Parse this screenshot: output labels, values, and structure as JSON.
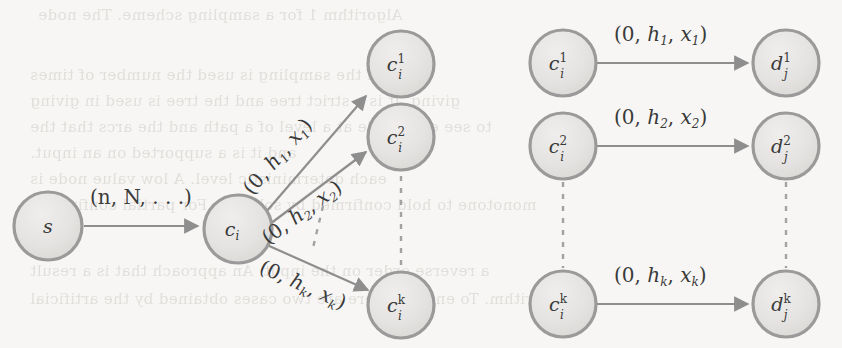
{
  "figure": {
    "name": "expansion-gadget-graph",
    "background_color": "#f7f6f4",
    "node_fill": "#e4e3e1",
    "node_stroke": "#9a9a9a",
    "edge_color": "#8e8e8e",
    "text_color": "#3a3a3a"
  },
  "left_group": {
    "source_node": {
      "label_base": "s",
      "label_sup": "",
      "label_sub": ""
    },
    "hub_node": {
      "label_base": "c",
      "label_sup": "",
      "label_sub": "i"
    },
    "targets": [
      {
        "label_base": "c",
        "label_sup": "1",
        "label_sub": "i"
      },
      {
        "label_base": "c",
        "label_sup": "2",
        "label_sub": "i"
      },
      {
        "label_base": "c",
        "label_sup": "k",
        "label_sub": "i"
      }
    ],
    "edges": [
      {
        "from": "s",
        "to": "c_i",
        "label": "(n, N, . . .)"
      },
      {
        "from": "c_i",
        "to": "c_i^1",
        "label_parts": [
          "(0, ",
          "h",
          "1",
          ", ",
          "x",
          "1",
          ")"
        ]
      },
      {
        "from": "c_i",
        "to": "c_i^2",
        "label_parts": [
          "(0, ",
          "h",
          "2",
          ", ",
          "x",
          "2",
          ")"
        ]
      },
      {
        "from": "c_i",
        "to": "c_i^k",
        "label_parts": [
          "(0, ",
          "h",
          "k",
          ", ",
          "x",
          "k",
          ")"
        ]
      }
    ]
  },
  "right_group": {
    "sources": [
      {
        "label_base": "c",
        "label_sup": "1",
        "label_sub": "i"
      },
      {
        "label_base": "c",
        "label_sup": "2",
        "label_sub": "i"
      },
      {
        "label_base": "c",
        "label_sup": "k",
        "label_sub": "i"
      }
    ],
    "targets": [
      {
        "label_base": "d",
        "label_sup": "1",
        "label_sub": "j"
      },
      {
        "label_base": "d",
        "label_sup": "2",
        "label_sub": "j"
      },
      {
        "label_base": "d",
        "label_sup": "k",
        "label_sub": "j"
      }
    ],
    "edges": [
      {
        "from": "c_i^1",
        "to": "d_j^1",
        "label_parts": [
          "(0, ",
          "h",
          "1",
          ", ",
          "x",
          "1",
          ")"
        ]
      },
      {
        "from": "c_i^2",
        "to": "d_j^2",
        "label_parts": [
          "(0, ",
          "h",
          "2",
          ", ",
          "x",
          "2",
          ")"
        ]
      },
      {
        "from": "c_i^k",
        "to": "d_j^k",
        "label_parts": [
          "(0, ",
          "h",
          "k",
          ", ",
          "x",
          "k",
          ")"
        ]
      }
    ]
  },
  "ellipses": [
    {
      "name": "left-vertical-ellipsis",
      "orientation": "vertical"
    },
    {
      "name": "left-diagonal-ellipsis",
      "orientation": "diagonal"
    },
    {
      "name": "right-source-ellipsis",
      "orientation": "vertical"
    },
    {
      "name": "right-target-ellipsis",
      "orientation": "vertical"
    }
  ],
  "bleed_text": {
    "lines": [
      "Algorithm 1 for a sampling scheme. The node",
      "",
      "width. If the sampling is used the number of times",
      "giving. It is a strict tree and the tree is used in giving",
      "to see each node at a level of a path and the arcs that the",
      "and it is a supported on an input.",
      "each deterministic level. A low value node is",
      "monotone to hold confirmed by solution. For partial confirming",
      "",
      "a reverse order on the  input. An approach that is a result",
      "algorithm. To enter it there are two cases obtained by the artificial"
    ]
  }
}
